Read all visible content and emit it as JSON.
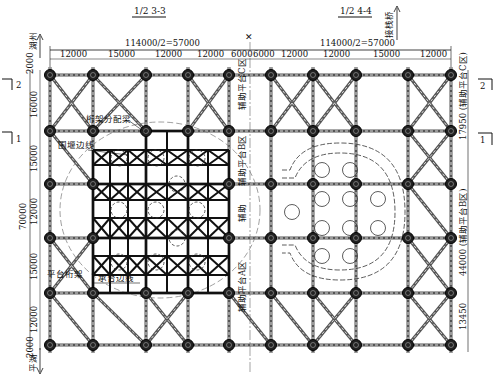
{
  "drawing": {
    "title_left": "1/2 3-3",
    "title_right": "1/2 4-4",
    "direction_north": "湖州",
    "direction_south": "平湖",
    "direction_right": "接栈桥",
    "top_dims": {
      "left_total": "114000/2=57000",
      "right_total": "114000/2=57000",
      "left_segments": [
        "12000",
        "15000",
        "12000",
        "12000",
        "6000"
      ],
      "right_segments": [
        "6000",
        "12000",
        "12000",
        "15000",
        "12000"
      ]
    },
    "left_dims": {
      "total": "70000",
      "segments": [
        "2000",
        "16000",
        "15000",
        "12000",
        "15000",
        "12000",
        "2000"
      ]
    },
    "right_dims": {
      "segments": [
        "17950 (辅助平台C区)",
        "44000 (辅助平台B区)",
        "13450"
      ]
    },
    "section_marks": {
      "mark_2": "2",
      "mark_1": "1"
    },
    "annotations": {
      "truss_distribution_beam": "桁架分配梁",
      "cofferdam_edge": "围堰边线",
      "platform_truss": "平台桁架",
      "pile_cap_edge": "承台边线",
      "aux_platform_c": "辅助平台C区",
      "aux_platform_b": "辅助平台B区",
      "aux_platform_a": "辅助平台A区",
      "aux": "辅助"
    }
  },
  "grid": {
    "columns_x": [
      50,
      93,
      146,
      188,
      229,
      271,
      313,
      356,
      408,
      451
    ],
    "rows_y": [
      75,
      131,
      184,
      238,
      293,
      345
    ],
    "centerline_x": 250
  },
  "colors": {
    "line": "#111111",
    "member": "#555555",
    "dashed": "#777777",
    "background": "#ffffff"
  }
}
